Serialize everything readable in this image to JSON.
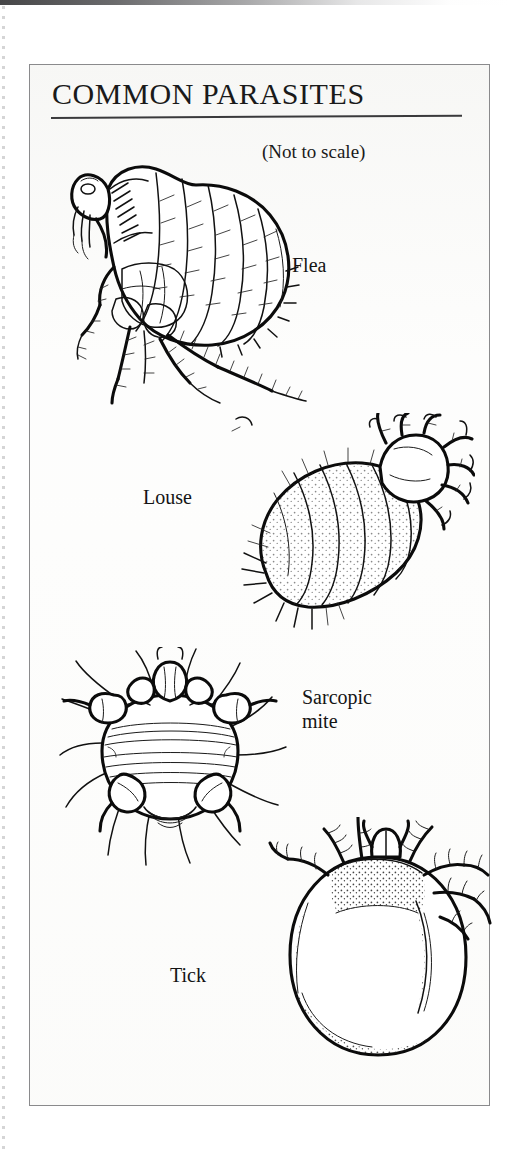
{
  "page": {
    "title": "COMMON PARASITES",
    "subtitle": "(Not to scale)",
    "background_color": "#ffffff",
    "paper_color": "#fdfdfc",
    "ink_color": "#111111",
    "frame_border_color": "#8a8a8c"
  },
  "figures": [
    {
      "id": "flea",
      "label": "Flea",
      "label_lines": [
        "Flea"
      ],
      "label_position": "right-of-illustration",
      "illustration": "line-drawing of a laterally compressed flea with segmented abdomen, bristles and long hind legs"
    },
    {
      "id": "louse",
      "label": "Louse",
      "label_lines": [
        "Louse"
      ],
      "label_position": "left-of-illustration",
      "illustration": "line-drawing of a louse with plump stippled segmented abdomen and clawed legs at the head end"
    },
    {
      "id": "sarcopic-mite",
      "label": "Sarcopic mite",
      "label_lines": [
        "Sarcopic",
        "mite"
      ],
      "label_position": "right-of-illustration",
      "illustration": "line-drawing of a rounded sarcoptic mite seen from above with stubby legs and long trailing setae"
    },
    {
      "id": "tick",
      "label": "Tick",
      "label_lines": [
        "Tick"
      ],
      "label_position": "left-of-illustration",
      "illustration": "line-drawing of an engorged oval tick with segmented legs and mouthparts at the top"
    }
  ]
}
